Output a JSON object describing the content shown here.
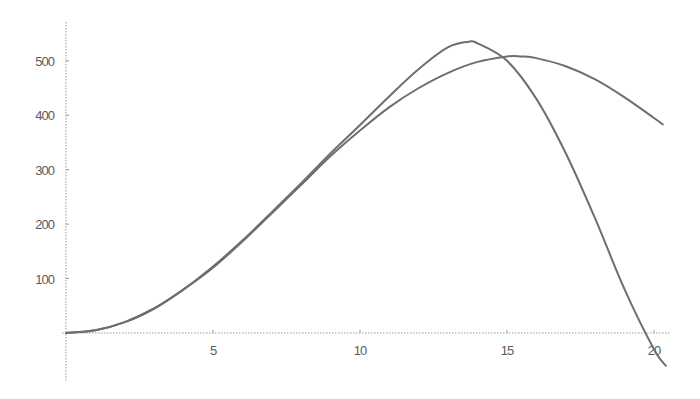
{
  "chart_data": {
    "type": "line",
    "title": "",
    "xlabel": "",
    "ylabel": "",
    "xlim": [
      0,
      20.6
    ],
    "ylim": [
      -60,
      550
    ],
    "grid": false,
    "legend": null,
    "x_ticks": [
      5,
      10,
      15,
      20
    ],
    "y_ticks": [
      100,
      200,
      300,
      400,
      500
    ],
    "x_tick_labels": [
      "5",
      "10",
      "15",
      "20"
    ],
    "y_tick_labels": [
      "100",
      "200",
      "300",
      "400",
      "500"
    ],
    "series": [
      {
        "name": "curve-1",
        "color": "#6e6e6e",
        "x": [
          0,
          1,
          2,
          3,
          4,
          5,
          6,
          7,
          8,
          9,
          10,
          11,
          12,
          13,
          13.7,
          14,
          15,
          16,
          17,
          18,
          19,
          20,
          20.4
        ],
        "y": [
          0,
          5,
          20,
          45,
          80,
          122,
          170,
          222,
          275,
          330,
          382,
          435,
          485,
          525,
          535,
          532,
          500,
          430,
          330,
          210,
          80,
          -30,
          -60
        ]
      },
      {
        "name": "curve-2",
        "color": "#6e6e6e",
        "x": [
          0,
          1,
          2,
          3,
          4,
          5,
          6,
          7,
          8,
          9,
          10,
          11,
          12,
          13,
          14,
          15,
          15.5,
          16,
          17,
          18,
          19,
          20,
          20.3
        ],
        "y": [
          0,
          5,
          20,
          45,
          80,
          120,
          168,
          220,
          272,
          325,
          372,
          415,
          450,
          478,
          498,
          508,
          508,
          505,
          490,
          466,
          433,
          395,
          383
        ]
      }
    ]
  }
}
